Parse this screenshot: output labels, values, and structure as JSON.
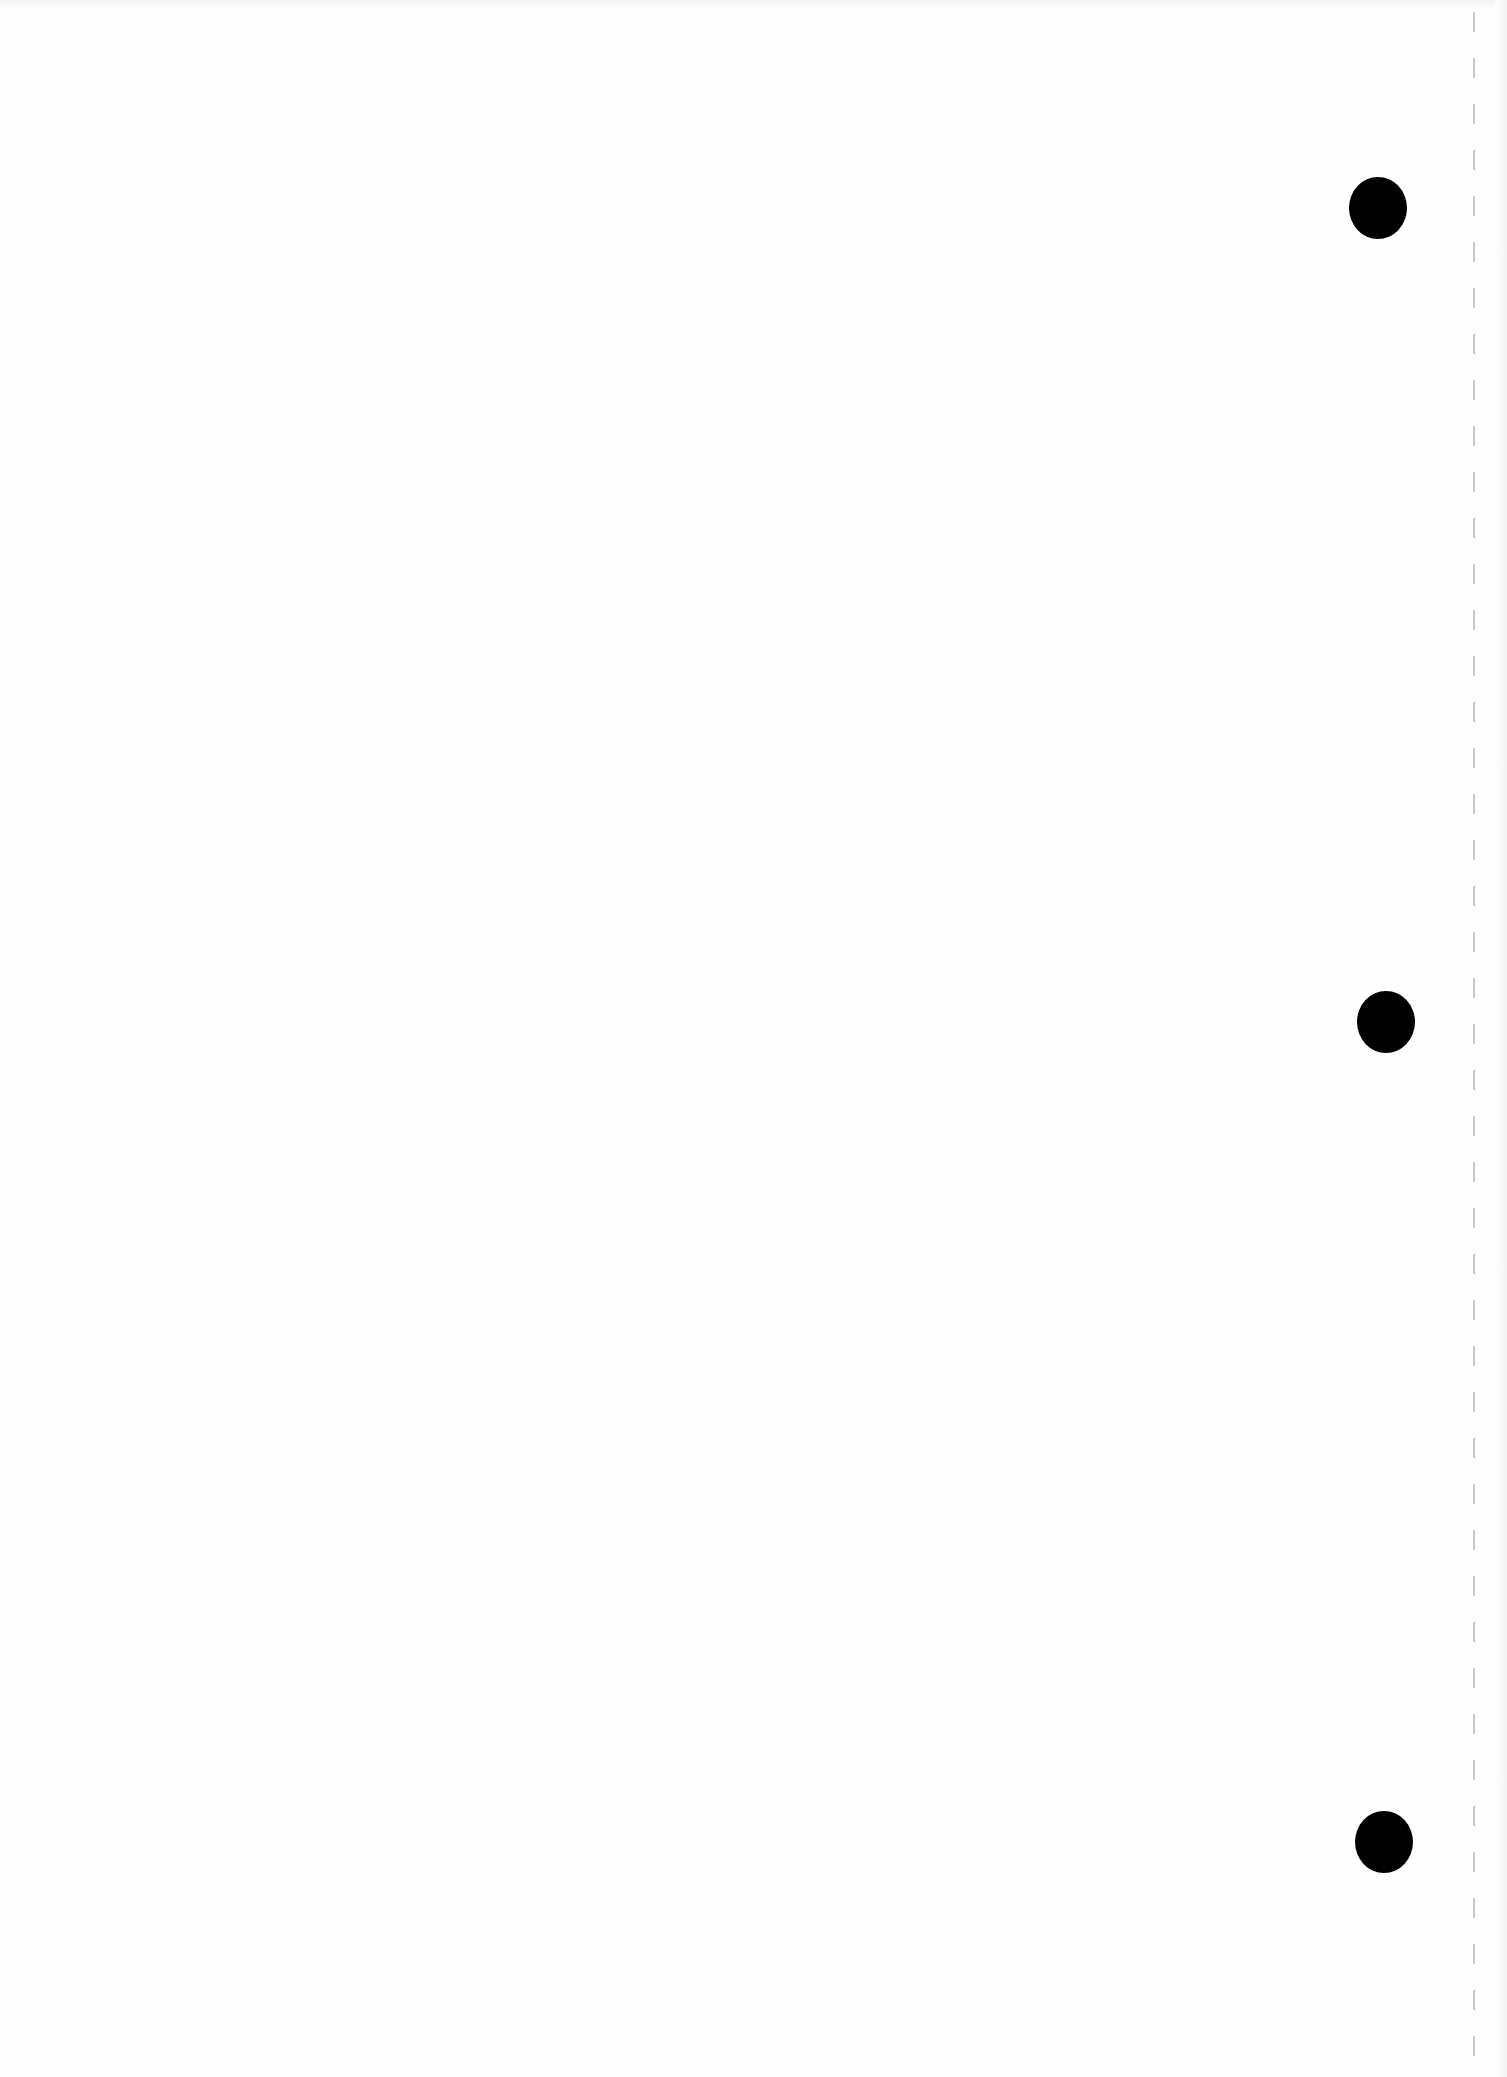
{
  "page": {
    "type": "blank scanned sheet",
    "background_color": "#fefefe",
    "text_content": ""
  },
  "punch_holes": [
    {
      "cx": 1378,
      "cy": 208,
      "w": 58,
      "h": 62,
      "color": "#000000"
    },
    {
      "cx": 1386,
      "cy": 1022,
      "w": 58,
      "h": 62,
      "color": "#000000"
    },
    {
      "cx": 1384,
      "cy": 1842,
      "w": 58,
      "h": 62,
      "color": "#000000"
    }
  ],
  "perforation_line": {
    "x": 1474,
    "color": "#c8c8c8"
  }
}
